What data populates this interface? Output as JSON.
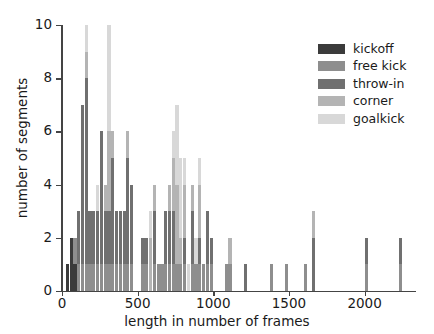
{
  "chart_data": {
    "type": "bar",
    "title": "",
    "subtitle": "",
    "xlabel": "length in number of frames",
    "ylabel": "number of segments",
    "xlim": [
      0,
      2300
    ],
    "ylim": [
      0,
      10
    ],
    "xticks": [
      0,
      500,
      1000,
      1500,
      2000
    ],
    "yticks": [
      0,
      2,
      4,
      6,
      8,
      10
    ],
    "xticklabels": [
      "0",
      "500",
      "1000",
      "1500",
      "2000"
    ],
    "yticklabels": [
      "0",
      "2",
      "4",
      "6",
      "8",
      "10"
    ],
    "grid": false,
    "stacked": true,
    "bin_width": 25,
    "legend_position": "upper right",
    "legend_entries": [
      {
        "label": "kickoff",
        "color": "#3b3b3b"
      },
      {
        "label": "free kick",
        "color": "#8e8e8e"
      },
      {
        "label": "throw-in",
        "color": "#707070"
      },
      {
        "label": "corner",
        "color": "#b4b4b4"
      },
      {
        "label": "goalkick",
        "color": "#d8d8d8"
      }
    ],
    "series": [
      {
        "name": "kickoff",
        "color": "#3b3b3b",
        "bins": [
          {
            "x": 25,
            "value": 1
          },
          {
            "x": 50,
            "value": 2
          },
          {
            "x": 75,
            "value": 1
          }
        ]
      },
      {
        "name": "free kick",
        "color": "#8e8e8e",
        "bins": [
          {
            "x": 75,
            "value": 1
          },
          {
            "x": 100,
            "value": 1
          },
          {
            "x": 125,
            "value": 1
          },
          {
            "x": 150,
            "value": 1
          },
          {
            "x": 175,
            "value": 1
          },
          {
            "x": 200,
            "value": 1
          },
          {
            "x": 225,
            "value": 1
          },
          {
            "x": 250,
            "value": 1
          },
          {
            "x": 275,
            "value": 1
          },
          {
            "x": 300,
            "value": 1
          },
          {
            "x": 325,
            "value": 1
          },
          {
            "x": 350,
            "value": 1
          },
          {
            "x": 375,
            "value": 1
          },
          {
            "x": 400,
            "value": 1
          },
          {
            "x": 425,
            "value": 1
          },
          {
            "x": 450,
            "value": 1
          },
          {
            "x": 525,
            "value": 1
          },
          {
            "x": 550,
            "value": 1
          },
          {
            "x": 600,
            "value": 1
          },
          {
            "x": 625,
            "value": 1
          },
          {
            "x": 650,
            "value": 1
          },
          {
            "x": 675,
            "value": 1
          },
          {
            "x": 700,
            "value": 1
          },
          {
            "x": 725,
            "value": 1
          },
          {
            "x": 750,
            "value": 1
          },
          {
            "x": 775,
            "value": 1
          },
          {
            "x": 800,
            "value": 1
          },
          {
            "x": 850,
            "value": 1
          },
          {
            "x": 875,
            "value": 1
          },
          {
            "x": 900,
            "value": 1
          },
          {
            "x": 925,
            "value": 1
          },
          {
            "x": 950,
            "value": 1
          },
          {
            "x": 975,
            "value": 1
          },
          {
            "x": 1075,
            "value": 1
          },
          {
            "x": 1100,
            "value": 1
          },
          {
            "x": 1375,
            "value": 1
          },
          {
            "x": 1475,
            "value": 1
          },
          {
            "x": 1600,
            "value": 1
          },
          {
            "x": 2000,
            "value": 1
          },
          {
            "x": 2225,
            "value": 1
          }
        ]
      },
      {
        "name": "throw-in",
        "color": "#707070",
        "bins": [
          {
            "x": 100,
            "value": 2
          },
          {
            "x": 125,
            "value": 6
          },
          {
            "x": 150,
            "value": 7
          },
          {
            "x": 175,
            "value": 2
          },
          {
            "x": 200,
            "value": 2
          },
          {
            "x": 225,
            "value": 2
          },
          {
            "x": 250,
            "value": 5
          },
          {
            "x": 275,
            "value": 2
          },
          {
            "x": 300,
            "value": 2
          },
          {
            "x": 325,
            "value": 4
          },
          {
            "x": 350,
            "value": 2
          },
          {
            "x": 375,
            "value": 2
          },
          {
            "x": 400,
            "value": 2
          },
          {
            "x": 425,
            "value": 4
          },
          {
            "x": 450,
            "value": 3
          },
          {
            "x": 525,
            "value": 1
          },
          {
            "x": 550,
            "value": 1
          },
          {
            "x": 600,
            "value": 2
          },
          {
            "x": 675,
            "value": 2
          },
          {
            "x": 700,
            "value": 2
          },
          {
            "x": 725,
            "value": 2
          },
          {
            "x": 800,
            "value": 1
          },
          {
            "x": 850,
            "value": 2
          },
          {
            "x": 900,
            "value": 1
          },
          {
            "x": 950,
            "value": 2
          },
          {
            "x": 975,
            "value": 1
          },
          {
            "x": 1200,
            "value": 1
          },
          {
            "x": 1650,
            "value": 2
          },
          {
            "x": 2000,
            "value": 1
          },
          {
            "x": 2225,
            "value": 1
          }
        ]
      },
      {
        "name": "corner",
        "color": "#b4b4b4",
        "bins": [
          {
            "x": 150,
            "value": 1
          },
          {
            "x": 275,
            "value": 1
          },
          {
            "x": 300,
            "value": 3
          },
          {
            "x": 325,
            "value": 1
          },
          {
            "x": 425,
            "value": 1
          },
          {
            "x": 575,
            "value": 2
          },
          {
            "x": 600,
            "value": 1
          },
          {
            "x": 700,
            "value": 1
          },
          {
            "x": 725,
            "value": 2
          },
          {
            "x": 750,
            "value": 3
          },
          {
            "x": 775,
            "value": 1
          },
          {
            "x": 800,
            "value": 2
          },
          {
            "x": 850,
            "value": 1
          },
          {
            "x": 900,
            "value": 2
          },
          {
            "x": 1100,
            "value": 1
          },
          {
            "x": 1650,
            "value": 1
          }
        ]
      },
      {
        "name": "goalkick",
        "color": "#d8d8d8",
        "bins": [
          {
            "x": 150,
            "value": 1
          },
          {
            "x": 225,
            "value": 1
          },
          {
            "x": 300,
            "value": 4
          },
          {
            "x": 575,
            "value": 1
          },
          {
            "x": 725,
            "value": 1
          },
          {
            "x": 750,
            "value": 3
          },
          {
            "x": 775,
            "value": 3
          },
          {
            "x": 800,
            "value": 1
          },
          {
            "x": 825,
            "value": 1
          },
          {
            "x": 875,
            "value": 1
          },
          {
            "x": 900,
            "value": 1
          }
        ]
      }
    ]
  }
}
